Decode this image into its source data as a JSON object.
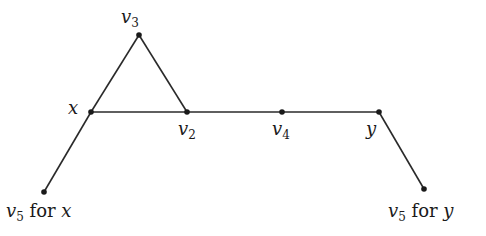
{
  "diagram": {
    "type": "graph",
    "colors": {
      "edge": "#2a2a2a",
      "node": "#1a1a1a",
      "background": "#ffffff"
    },
    "nodes": [
      {
        "id": "v3",
        "x": 139,
        "y": 35,
        "label_main": "v",
        "label_sub": "3",
        "label_suffix": ""
      },
      {
        "id": "x",
        "x": 91,
        "y": 112,
        "label_main": "x",
        "label_sub": "",
        "label_suffix": ""
      },
      {
        "id": "v2",
        "x": 187,
        "y": 112,
        "label_main": "v",
        "label_sub": "2",
        "label_suffix": ""
      },
      {
        "id": "v4",
        "x": 282,
        "y": 112,
        "label_main": "v",
        "label_sub": "4",
        "label_suffix": ""
      },
      {
        "id": "y",
        "x": 379,
        "y": 112,
        "label_main": "y",
        "label_sub": "",
        "label_suffix": ""
      },
      {
        "id": "v5x",
        "x": 44,
        "y": 192,
        "label_main": "v",
        "label_sub": "5",
        "label_suffix": " for ",
        "label_tail": "x"
      },
      {
        "id": "v5y",
        "x": 424,
        "y": 189,
        "label_main": "v",
        "label_sub": "5",
        "label_suffix": " for ",
        "label_tail": "y"
      }
    ],
    "edges": [
      [
        "x",
        "v3"
      ],
      [
        "v3",
        "v2"
      ],
      [
        "x",
        "v2"
      ],
      [
        "v2",
        "v4"
      ],
      [
        "v4",
        "y"
      ],
      [
        "x",
        "v5x"
      ],
      [
        "y",
        "v5y"
      ]
    ]
  }
}
